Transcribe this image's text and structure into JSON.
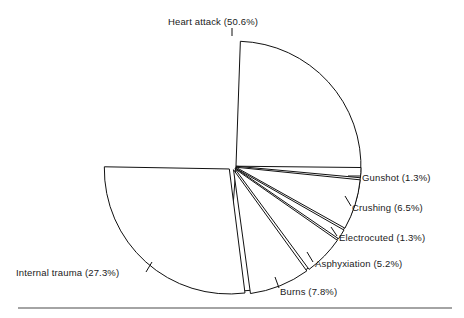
{
  "figure": {
    "background_color": "#ffffff",
    "line_color": "#111111",
    "text_color": "#1a1a1a",
    "rule_color": "#4a4a4a"
  },
  "chart_data": {
    "type": "pie",
    "title": "",
    "xlabel": "",
    "ylabel": "",
    "legend_position": "none",
    "grid": false,
    "exploded": true,
    "labels_show_percent": true,
    "categories": [
      "Heart attack",
      "Gunshot",
      "Crushing",
      "Electrocuted",
      "Asphyxiation",
      "Burns",
      "Internal trauma"
    ],
    "values": [
      50.6,
      1.3,
      6.5,
      1.3,
      5.2,
      7.8,
      27.3
    ],
    "units": "percent",
    "slices": [
      {
        "name": "Heart attack",
        "value": 50.6,
        "label": "Heart attack (50.6%)",
        "start_angle_deg": 272.0,
        "end_angle_deg": 454.2,
        "explode_dir_deg": 3.1,
        "label_x": 213,
        "label_y": 17,
        "label_align": "center",
        "leader": [
          [
            232,
            28
          ],
          [
            232,
            36
          ]
        ]
      },
      {
        "name": "Gunshot",
        "value": 1.3,
        "label": "Gunshot (1.3%)",
        "start_angle_deg": 0.6,
        "end_angle_deg": 5.3,
        "explode_dir_deg": 3.0,
        "label_x": 362,
        "label_y": 173,
        "label_align": "left",
        "leader": [
          [
            348,
            176
          ],
          [
            360,
            176
          ]
        ]
      },
      {
        "name": "Crushing",
        "value": 6.5,
        "label": "Crushing (6.5%)",
        "start_angle_deg": 5.8,
        "end_angle_deg": 29.2,
        "explode_dir_deg": 17.5,
        "label_x": 352,
        "label_y": 203,
        "label_align": "left",
        "leader": [
          [
            345,
            196
          ],
          [
            351,
            206
          ]
        ]
      },
      {
        "name": "Electrocuted",
        "value": 1.3,
        "label": "Electrocuted (1.3%)",
        "start_angle_deg": 29.7,
        "end_angle_deg": 34.4,
        "explode_dir_deg": 32.0,
        "label_x": 339,
        "label_y": 233,
        "label_align": "left",
        "leader": [
          [
            331,
            227
          ],
          [
            337,
            236
          ]
        ]
      },
      {
        "name": "Asphyxiation",
        "value": 5.2,
        "label": "Asphyxiation (5.2%)",
        "start_angle_deg": 34.9,
        "end_angle_deg": 53.6,
        "explode_dir_deg": 44.0,
        "label_x": 315,
        "label_y": 259,
        "label_align": "left",
        "leader": [
          [
            307,
            252
          ],
          [
            313,
            262
          ]
        ]
      },
      {
        "name": "Burns",
        "value": 7.8,
        "label": "Burns (7.8%)",
        "start_angle_deg": 54.1,
        "end_angle_deg": 82.2,
        "explode_dir_deg": 68.0,
        "label_x": 280,
        "label_y": 287,
        "label_align": "left",
        "leader": [
          [
            275,
            277
          ],
          [
            279,
            288
          ]
        ]
      },
      {
        "name": "Internal trauma",
        "value": 27.3,
        "label": "Internal trauma (27.3%)",
        "start_angle_deg": 82.8,
        "end_angle_deg": 181.0,
        "explode_dir_deg": 132.0,
        "label_x": 16,
        "label_y": 268,
        "label_align": "left",
        "leader": [
          [
            152,
            262
          ],
          [
            146,
            272
          ]
        ]
      }
    ],
    "geometry": {
      "center_x": 232,
      "center_y": 166,
      "radius": 125,
      "explode_offset": 4
    }
  },
  "footer_rule": {
    "x1": 18,
    "x2": 452,
    "y": 308
  }
}
